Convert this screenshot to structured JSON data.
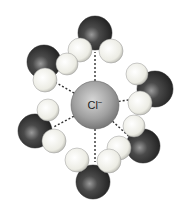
{
  "diagram": {
    "center_ion": {
      "label": "Cl",
      "charge": "−",
      "cx": 95,
      "cy": 105,
      "r": 24,
      "color": "#9a9a9a"
    },
    "colors": {
      "oxygen": "#3a3a3a",
      "hydrogen": "#f2f2ea",
      "bond_dash": "#333333"
    },
    "water_molecules": [
      {
        "name": "top",
        "O": [
          95,
          33,
          17
        ],
        "H": [
          [
            80,
            50,
            12
          ],
          [
            111,
            51,
            12
          ]
        ],
        "bond_from": [
          95,
          62
        ]
      },
      {
        "name": "upper-left",
        "O": [
          44,
          62,
          17
        ],
        "H": [
          [
            67,
            64,
            11
          ],
          [
            45,
            80,
            12
          ]
        ],
        "bond_from": [
          55,
          82
        ]
      },
      {
        "name": "right",
        "O": [
          155,
          89,
          18
        ],
        "H": [
          [
            137,
            74,
            11
          ],
          [
            140,
            103,
            12
          ]
        ],
        "bond_from": [
          128,
          100
        ]
      },
      {
        "name": "lower-left",
        "O": [
          35,
          131,
          17
        ],
        "H": [
          [
            48,
            110,
            11
          ],
          [
            54,
            141,
            12
          ]
        ],
        "bond_from": [
          63,
          122
        ]
      },
      {
        "name": "lower-right",
        "O": [
          143,
          146,
          17
        ],
        "H": [
          [
            134,
            126,
            11
          ],
          [
            119,
            148,
            12
          ]
        ],
        "bond_from": [
          122,
          130
        ]
      },
      {
        "name": "bottom",
        "O": [
          93,
          182,
          17
        ],
        "H": [
          [
            77,
            160,
            12
          ],
          [
            109,
            161,
            12
          ]
        ],
        "bond_from": [
          95,
          152
        ]
      }
    ]
  }
}
